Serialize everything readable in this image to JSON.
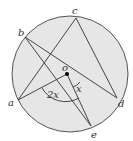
{
  "diagram": {
    "type": "circle-theorem",
    "circle": {
      "cx": 70,
      "cy": 74,
      "r": 58,
      "fill": "#e6e6e6",
      "stroke": "#555555"
    },
    "center": {
      "label": "o",
      "x": 67,
      "y": 74
    },
    "points": {
      "a": {
        "label": "a",
        "x": 18,
        "y": 100
      },
      "b": {
        "label": "b",
        "x": 25,
        "y": 37
      },
      "c": {
        "label": "c",
        "x": 76,
        "y": 18
      },
      "d": {
        "label": "d",
        "x": 117,
        "y": 98
      },
      "e": {
        "label": "e",
        "x": 91,
        "y": 126
      }
    },
    "segments": [
      [
        "a",
        "c"
      ],
      [
        "c",
        "d"
      ],
      [
        "b",
        "d"
      ],
      [
        "b",
        "e"
      ],
      [
        "a",
        "o"
      ],
      [
        "o",
        "e"
      ]
    ],
    "angles": {
      "aoe": {
        "label": "2x"
      },
      "eod": {
        "label": "x"
      }
    }
  }
}
